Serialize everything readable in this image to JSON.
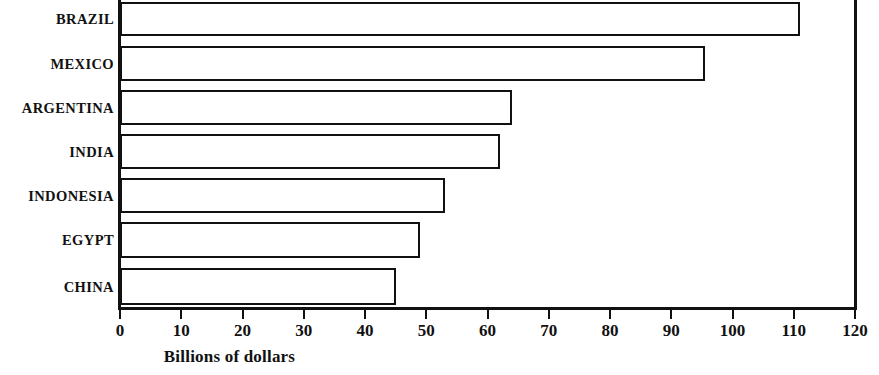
{
  "chart_data": {
    "type": "bar",
    "orientation": "horizontal",
    "title": "",
    "subtitle": "",
    "xlabel": "Billions of dollars",
    "ylabel": "",
    "categories": [
      "BRAZIL",
      "MEXICO",
      "ARGENTINA",
      "INDIA",
      "INDONESIA",
      "EGYPT",
      "CHINA"
    ],
    "values": [
      111,
      95.5,
      64,
      62,
      53,
      49,
      45
    ],
    "xlim": [
      0,
      120
    ],
    "xticks": [
      0,
      10,
      20,
      30,
      40,
      50,
      60,
      70,
      80,
      90,
      100,
      110,
      120
    ],
    "xtick_labels": [
      "0",
      "10",
      "20",
      "30",
      "40",
      "50",
      "60",
      "70",
      "80",
      "90",
      "100",
      "110",
      "120"
    ],
    "grid": false,
    "legend": null,
    "legend_position": "none",
    "bar_fill_color": "#ffffff",
    "bar_edge_color": "#111111",
    "background_color": "#ffffff",
    "annotations": []
  },
  "bars": [
    {
      "label": "BRAZIL",
      "value": 111,
      "top": 2,
      "height": 34
    },
    {
      "label": "MEXICO",
      "value": 95.5,
      "top": 46,
      "height": 35
    },
    {
      "label": "ARGENTINA",
      "value": 64,
      "top": 90,
      "height": 35
    },
    {
      "label": "INDIA",
      "value": 62,
      "top": 134,
      "height": 35
    },
    {
      "label": "INDONESIA",
      "value": 53,
      "top": 178,
      "height": 35
    },
    {
      "label": "EGYPT",
      "value": 49,
      "top": 222,
      "height": 36
    },
    {
      "label": "CHINA",
      "value": 45,
      "top": 268,
      "height": 37
    }
  ]
}
